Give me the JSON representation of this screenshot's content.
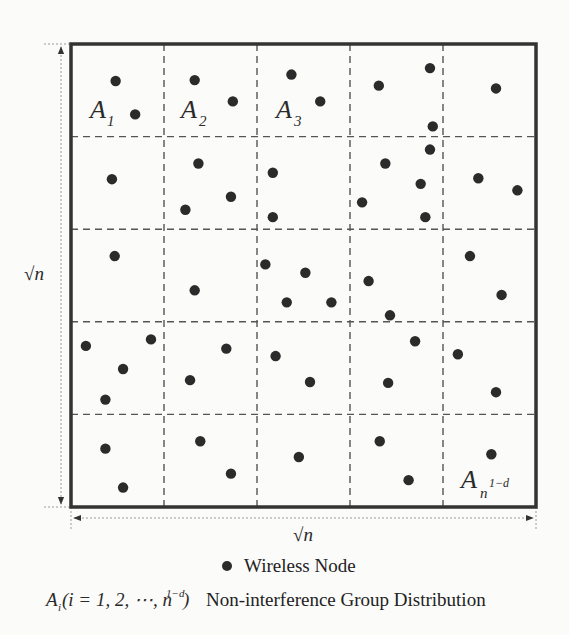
{
  "diagram": {
    "grid": {
      "rows": 5,
      "cols": 5
    },
    "side_label": "√n",
    "bottom_label": "√n",
    "cell_labels": [
      {
        "base": "A",
        "sub": "1",
        "cell": [
          0,
          0
        ]
      },
      {
        "base": "A",
        "sub": "2",
        "cell": [
          1,
          0
        ]
      },
      {
        "base": "A",
        "sub": "3",
        "cell": [
          2,
          0
        ]
      },
      {
        "base": "A",
        "sub": "n",
        "sup": "1−d",
        "cell": [
          4,
          4
        ]
      }
    ],
    "nodes": [
      [
        0.48,
        0.4
      ],
      [
        0.69,
        0.76
      ],
      [
        1.33,
        0.39
      ],
      [
        1.74,
        0.62
      ],
      [
        2.37,
        0.33
      ],
      [
        2.68,
        0.62
      ],
      [
        3.31,
        0.45
      ],
      [
        3.86,
        0.26
      ],
      [
        4.57,
        0.48
      ],
      [
        3.89,
        0.89
      ],
      [
        0.44,
        1.46
      ],
      [
        1.37,
        1.29
      ],
      [
        1.72,
        1.65
      ],
      [
        1.23,
        1.79
      ],
      [
        2.17,
        1.39
      ],
      [
        2.17,
        1.87
      ],
      [
        3.86,
        1.14
      ],
      [
        3.38,
        1.29
      ],
      [
        3.76,
        1.51
      ],
      [
        3.13,
        1.71
      ],
      [
        3.81,
        1.87
      ],
      [
        4.38,
        1.45
      ],
      [
        4.8,
        1.58
      ],
      [
        0.47,
        2.29
      ],
      [
        1.33,
        2.66
      ],
      [
        2.09,
        2.38
      ],
      [
        2.52,
        2.47
      ],
      [
        2.32,
        2.79
      ],
      [
        2.8,
        2.79
      ],
      [
        3.2,
        2.56
      ],
      [
        3.43,
        2.93
      ],
      [
        4.29,
        2.29
      ],
      [
        4.63,
        2.71
      ],
      [
        0.16,
        3.26
      ],
      [
        0.86,
        3.19
      ],
      [
        0.56,
        3.51
      ],
      [
        0.37,
        3.84
      ],
      [
        1.67,
        3.29
      ],
      [
        1.28,
        3.63
      ],
      [
        2.2,
        3.37
      ],
      [
        2.57,
        3.65
      ],
      [
        3.7,
        3.21
      ],
      [
        4.16,
        3.35
      ],
      [
        3.41,
        3.66
      ],
      [
        4.57,
        3.76
      ],
      [
        0.37,
        4.37
      ],
      [
        0.56,
        4.79
      ],
      [
        1.39,
        4.29
      ],
      [
        1.72,
        4.64
      ],
      [
        2.45,
        4.46
      ],
      [
        3.32,
        4.29
      ],
      [
        3.63,
        4.71
      ],
      [
        4.52,
        4.43
      ]
    ]
  },
  "legend": {
    "node_label": "Wireless Node",
    "group_symbol": {
      "base": "A",
      "sub": "i",
      "paren": "(i = 1, 2, ⋯, n",
      "sup": "1−d",
      "close": ")"
    },
    "group_label": "Non-interference Group Distribution"
  },
  "colors": {
    "node": "#2b2b2b",
    "border": "#333333",
    "dash": "#555555",
    "arrow": "#8a8a8a"
  }
}
